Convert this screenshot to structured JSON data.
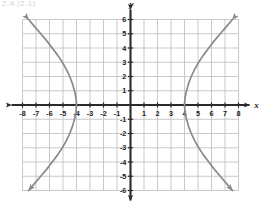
{
  "figure": {
    "clipped_header_text": "2.4  [2.1]",
    "background_color": "#ffffff",
    "grid_color": "#c3c3c3",
    "axis_color": "#2b2b2b",
    "curve_color": "#8a8a8a",
    "label_color": "#1a1a1a"
  },
  "axis_titles": {
    "x": "x",
    "y": "y"
  },
  "chart_data": {
    "type": "line",
    "title": "",
    "subtitle": "",
    "xlabel": "x",
    "ylabel": "y",
    "xlim": [
      -8,
      8
    ],
    "ylim": [
      -6,
      6
    ],
    "grid": true,
    "grid_step": 1,
    "legend_position": "none",
    "xticks": [
      -8,
      -7,
      -6,
      -5,
      -4,
      -3,
      -2,
      -1,
      1,
      2,
      3,
      4,
      5,
      6,
      7,
      8
    ],
    "yticks": [
      -6,
      -5,
      -4,
      -3,
      -2,
      -1,
      1,
      2,
      3,
      4,
      5,
      6
    ],
    "xtick_labels": [
      "-8",
      "-7",
      "-6",
      "-5",
      "-4",
      "-3",
      "-2",
      "-1",
      "1",
      "2",
      "3",
      "4",
      "5",
      "6",
      "7",
      "8"
    ],
    "ytick_labels": [
      "-6",
      "-5",
      "-4",
      "-3",
      "-2",
      "-1",
      "1",
      "2",
      "3",
      "4",
      "5",
      "6"
    ],
    "origin_label": "",
    "annotations": [
      {
        "name": "right-vertex",
        "x": 4,
        "y": 0
      },
      {
        "name": "left-vertex",
        "x": -4,
        "y": 0
      }
    ],
    "series": [
      {
        "name": "hyperbola-right-branch",
        "color": "#8a8a8a",
        "arrow_start": true,
        "arrow_end": true,
        "points": [
          {
            "x": 7.55,
            "y": 6.0
          },
          {
            "x": 7.1,
            "y": 5.5
          },
          {
            "x": 6.65,
            "y": 5.0
          },
          {
            "x": 6.2,
            "y": 4.5
          },
          {
            "x": 5.8,
            "y": 4.0
          },
          {
            "x": 5.4,
            "y": 3.5
          },
          {
            "x": 5.05,
            "y": 3.0
          },
          {
            "x": 4.75,
            "y": 2.5
          },
          {
            "x": 4.5,
            "y": 2.0
          },
          {
            "x": 4.3,
            "y": 1.5
          },
          {
            "x": 4.15,
            "y": 1.0
          },
          {
            "x": 4.04,
            "y": 0.5
          },
          {
            "x": 4.0,
            "y": 0.0
          },
          {
            "x": 4.04,
            "y": -0.5
          },
          {
            "x": 4.15,
            "y": -1.0
          },
          {
            "x": 4.3,
            "y": -1.5
          },
          {
            "x": 4.5,
            "y": -2.0
          },
          {
            "x": 4.75,
            "y": -2.5
          },
          {
            "x": 5.05,
            "y": -3.0
          },
          {
            "x": 5.4,
            "y": -3.5
          },
          {
            "x": 5.8,
            "y": -4.0
          },
          {
            "x": 6.2,
            "y": -4.5
          },
          {
            "x": 6.65,
            "y": -5.0
          },
          {
            "x": 7.1,
            "y": -5.5
          },
          {
            "x": 7.55,
            "y": -6.0
          }
        ]
      },
      {
        "name": "hyperbola-left-branch",
        "color": "#8a8a8a",
        "arrow_start": true,
        "arrow_end": true,
        "points": [
          {
            "x": -7.55,
            "y": 6.0
          },
          {
            "x": -7.1,
            "y": 5.5
          },
          {
            "x": -6.65,
            "y": 5.0
          },
          {
            "x": -6.2,
            "y": 4.5
          },
          {
            "x": -5.8,
            "y": 4.0
          },
          {
            "x": -5.4,
            "y": 3.5
          },
          {
            "x": -5.05,
            "y": 3.0
          },
          {
            "x": -4.75,
            "y": 2.5
          },
          {
            "x": -4.5,
            "y": 2.0
          },
          {
            "x": -4.3,
            "y": 1.5
          },
          {
            "x": -4.15,
            "y": 1.0
          },
          {
            "x": -4.04,
            "y": 0.5
          },
          {
            "x": -4.0,
            "y": 0.0
          },
          {
            "x": -4.04,
            "y": -0.5
          },
          {
            "x": -4.15,
            "y": -1.0
          },
          {
            "x": -4.3,
            "y": -1.5
          },
          {
            "x": -4.5,
            "y": -2.0
          },
          {
            "x": -4.75,
            "y": -2.5
          },
          {
            "x": -5.05,
            "y": -3.0
          },
          {
            "x": -5.4,
            "y": -3.5
          },
          {
            "x": -5.8,
            "y": -4.0
          },
          {
            "x": -6.2,
            "y": -4.5
          },
          {
            "x": -6.65,
            "y": -5.0
          },
          {
            "x": -7.1,
            "y": -5.5
          },
          {
            "x": -7.55,
            "y": -6.0
          }
        ]
      }
    ]
  }
}
